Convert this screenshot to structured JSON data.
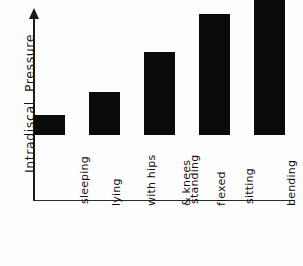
{
  "chart_data": {
    "type": "bar",
    "title": "",
    "xlabel": "",
    "ylabel": "Intradiscal  Pressure",
    "categories": [
      "sleeping",
      "lying with hips & knees flexed",
      "standing",
      "sitting",
      "bending & lifting"
    ],
    "category_lines": [
      [
        "sleeping"
      ],
      [
        "lying",
        "with hips",
        "& knees",
        "flexed"
      ],
      [
        "standing"
      ],
      [
        "sitting"
      ],
      [
        "bending",
        "&",
        "lifting"
      ]
    ],
    "values": [
      11,
      23,
      45,
      66,
      97
    ],
    "ylim": [
      0,
      105
    ],
    "grid": false,
    "legend": false,
    "bar_color": "#0b0b0b",
    "axis_color": "#1a1a1a",
    "background": "#fdfdfd"
  },
  "axes": {
    "y_title": "Intradiscal  Pressure",
    "y_arrow": "up-arrow-icon",
    "x_baseline": "x-axis-baseline"
  },
  "bars": [
    {
      "label": "sleeping",
      "value": 11,
      "x": 34,
      "width": 31,
      "height_px": 20
    },
    {
      "label": "lying with hips & knees flexed",
      "value": 23,
      "x": 89,
      "width": 31,
      "height_px": 43
    },
    {
      "label": "standing",
      "value": 45,
      "x": 144,
      "width": 31,
      "height_px": 83
    },
    {
      "label": "sitting",
      "value": 66,
      "x": 199,
      "width": 31,
      "height_px": 121
    },
    {
      "label": "bending & lifting",
      "value": 97,
      "x": 254,
      "width": 31,
      "height_px": 178
    }
  ],
  "tick_labels": {
    "t0_l0": "sleeping",
    "t1_l0": "lying",
    "t1_l1": "with hips",
    "t1_l2": "& knees",
    "t1_l3": "flexed",
    "t2_l0": "standing",
    "t3_l0": "sitting",
    "t4_l0": "bending",
    "t4_l1": "&",
    "t4_l2": "lifting"
  }
}
